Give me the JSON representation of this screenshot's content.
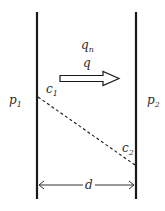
{
  "diagram": {
    "type": "membrane-diffusion-schematic",
    "labels": {
      "flux_n": {
        "base": "q",
        "sub": "n"
      },
      "flux": {
        "base": "q"
      },
      "pressure_left": {
        "base": "p",
        "sub": "1"
      },
      "pressure_right": {
        "base": "p",
        "sub": "2"
      },
      "conc_left": {
        "base": "c",
        "sub": "1"
      },
      "conc_right": {
        "base": "c",
        "sub": "2"
      },
      "thickness": {
        "base": "d"
      }
    },
    "colors": {
      "line": "#1a1a1a",
      "text": "#2a2a2a",
      "background": "#ffffff"
    }
  }
}
